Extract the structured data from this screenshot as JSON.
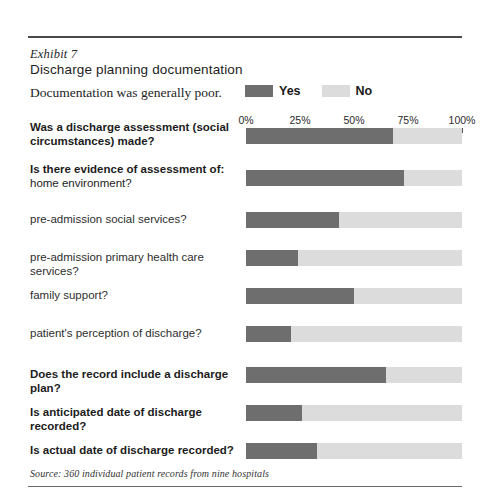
{
  "exhibit": {
    "number_label": "Exhibit 7",
    "title": "Discharge planning documentation",
    "subtitle": "Documentation was generally poor."
  },
  "legend": {
    "yes_label": "Yes",
    "no_label": "No",
    "yes_color": "#6e6e6e",
    "no_color": "#dcdcdc"
  },
  "source": "Source: 360 individual patient records from nine hospitals",
  "chart_data": {
    "type": "bar",
    "orientation": "horizontal",
    "stacked": true,
    "title": "Discharge planning documentation",
    "subtitle": "Documentation was generally poor.",
    "xlabel": "",
    "ylabel": "",
    "xlim": [
      0,
      100
    ],
    "grid": false,
    "legend_position": "top-right",
    "tick_labels": [
      "0%",
      "25%",
      "50%",
      "75%",
      "100%"
    ],
    "tick_values": [
      0,
      25,
      50,
      75,
      100
    ],
    "categories": [
      "Was a discharge assessment (social circumstances) made?",
      "Is there evidence of assessment of: home environment?",
      "pre-admission social services?",
      "pre-admission primary health care services?",
      "family support?",
      "patient's perception of discharge?",
      "Does the record include a discharge plan?",
      "Is anticipated date of discharge recorded?",
      "Is actual date of discharge recorded?"
    ],
    "series": [
      {
        "name": "Yes",
        "color": "#6e6e6e",
        "values": [
          68,
          73,
          43,
          24,
          50,
          21,
          65,
          26,
          33
        ]
      },
      {
        "name": "No",
        "color": "#dcdcdc",
        "values": [
          32,
          27,
          57,
          76,
          50,
          79,
          35,
          74,
          67
        ]
      }
    ]
  },
  "rows": [
    {
      "line1": "Was a discharge assessment (social",
      "line2": "circumstances) made?",
      "weight": "bold",
      "lines": 2,
      "yes": 68,
      "no": 32,
      "top": 0
    },
    {
      "line1": "Is there evidence of assessment of:",
      "line2": "home environment?",
      "weight": "mixed",
      "lines": 2,
      "yes": 73,
      "no": 27,
      "top": 42
    },
    {
      "line1": "pre-admission social services?",
      "line2": "",
      "weight": "light",
      "lines": 1,
      "yes": 43,
      "no": 57,
      "top": 84
    },
    {
      "line1": "pre-admission primary health care services?",
      "line2": "",
      "weight": "light",
      "lines": 1,
      "yes": 24,
      "no": 76,
      "top": 122
    },
    {
      "line1": "family support?",
      "line2": "",
      "weight": "light",
      "lines": 1,
      "yes": 50,
      "no": 50,
      "top": 160
    },
    {
      "line1": "patient's perception of discharge?",
      "line2": "",
      "weight": "light",
      "lines": 1,
      "yes": 21,
      "no": 79,
      "top": 198
    },
    {
      "line1": "Does the record include a discharge plan?",
      "line2": "",
      "weight": "bold",
      "lines": 1,
      "yes": 65,
      "no": 35,
      "top": 239
    },
    {
      "line1": "Is anticipated date of discharge recorded?",
      "line2": "",
      "weight": "bold",
      "lines": 1,
      "yes": 26,
      "no": 74,
      "top": 277
    },
    {
      "line1": "Is actual date of discharge recorded?",
      "line2": "",
      "weight": "bold",
      "lines": 1,
      "yes": 33,
      "no": 67,
      "top": 315
    }
  ]
}
